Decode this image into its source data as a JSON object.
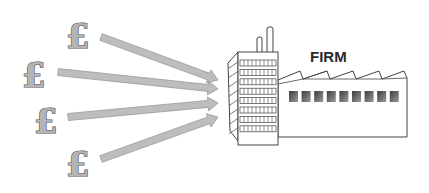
{
  "diagram": {
    "label": "FIRM",
    "sources": [
      {
        "symbol": "£",
        "icon": "pound-sign-icon"
      },
      {
        "symbol": "£",
        "icon": "pound-sign-icon"
      },
      {
        "symbol": "£",
        "icon": "pound-sign-icon"
      },
      {
        "symbol": "£",
        "icon": "pound-sign-icon"
      }
    ],
    "target": "factory-building",
    "colors": {
      "arrow": "#bdbdbd",
      "arrow_edge": "#9a9a9a",
      "pound_fill": "#b4b4b4",
      "outline": "#444444",
      "text": "#2a2a2a",
      "window_dark": "#3c3c3c",
      "window_light": "#9a9a9a"
    }
  }
}
